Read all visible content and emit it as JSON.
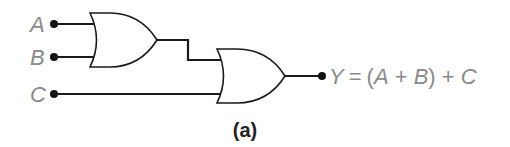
{
  "diagram": {
    "type": "logic-circuit",
    "inputs": [
      {
        "label": "A"
      },
      {
        "label": "B"
      },
      {
        "label": "C"
      }
    ],
    "gates": [
      {
        "id": "or1",
        "kind": "OR",
        "inputs": [
          "A",
          "B"
        ]
      },
      {
        "id": "or2",
        "kind": "OR",
        "inputs": [
          "or1",
          "C"
        ]
      }
    ],
    "output": {
      "label": "Y",
      "equals": "=",
      "expression_parts": [
        "(",
        "A",
        " + ",
        "B",
        ")",
        " + ",
        "C"
      ],
      "expression": "Y = (A + B) + C"
    },
    "caption": "(a)",
    "colors": {
      "wire": "#1a1a1a",
      "label": "#8a8a8a",
      "caption": "#222222"
    }
  }
}
